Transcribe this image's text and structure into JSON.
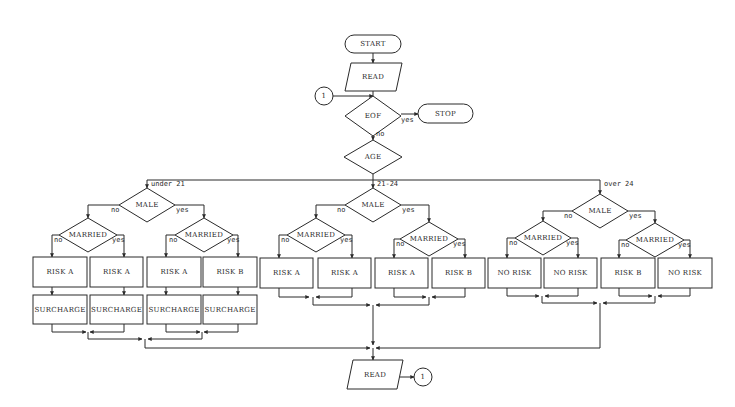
{
  "diagram": {
    "type": "flowchart",
    "top": {
      "start": "START",
      "read": "READ",
      "connector_in": "1",
      "eof": "EOF",
      "eof_yes": "yes",
      "eof_no": "no",
      "stop": "STOP",
      "age": "AGE"
    },
    "branches": [
      {
        "condition": "under 21",
        "male": "MALE",
        "male_no": "no",
        "male_yes": "yes",
        "female": {
          "married": "MARRIED",
          "no": "no",
          "yes": "yes",
          "outcome_no": "RISK A",
          "outcome_yes": "RISK A"
        },
        "male_branch": {
          "married": "MARRIED",
          "no": "no",
          "yes": "yes",
          "outcome_no": "RISK A",
          "outcome_yes": "RISK B"
        },
        "extra": [
          "SURCHARGE",
          "SURCHARGE",
          "SURCHARGE",
          "SURCHARGE"
        ]
      },
      {
        "condition": "21-24",
        "male": "MALE",
        "male_no": "no",
        "male_yes": "yes",
        "female": {
          "married": "MARRIED",
          "no": "no",
          "yes": "yes",
          "outcome_no": "RISK A",
          "outcome_yes": "RISK A"
        },
        "male_branch": {
          "married": "MARRIED",
          "no": "no",
          "yes": "yes",
          "outcome_no": "RISK A",
          "outcome_yes": "RISK B"
        }
      },
      {
        "condition": "over 24",
        "male": "MALE",
        "male_no": "no",
        "male_yes": "yes",
        "female": {
          "married": "MARRIED",
          "no": "no",
          "yes": "yes",
          "outcome_no": "NO RISK",
          "outcome_yes": "NO RISK"
        },
        "male_branch": {
          "married": "MARRIED",
          "no": "no",
          "yes": "yes",
          "outcome_no": "RISK B",
          "outcome_yes": "NO RISK"
        }
      }
    ],
    "bottom": {
      "read": "READ",
      "connector_out": "1"
    }
  }
}
